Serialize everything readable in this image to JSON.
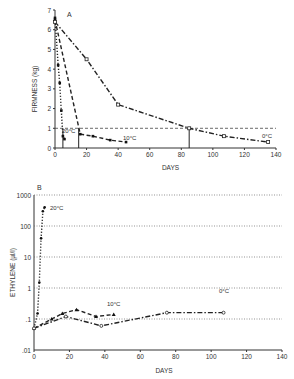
{
  "chart_data": [
    {
      "panel": "A",
      "type": "line",
      "title": "",
      "xlabel": "DAYS",
      "ylabel": "FIRMNESS (kg)",
      "xlim": [
        0,
        140
      ],
      "ylim": [
        0,
        7
      ],
      "xticks": [
        0,
        20,
        40,
        60,
        80,
        100,
        120,
        140
      ],
      "yticks": [
        0,
        1,
        2,
        3,
        4,
        5,
        6,
        7
      ],
      "grid": false,
      "reference_line": {
        "y": 1,
        "style": "dashed"
      },
      "drop_lines_x": [
        5,
        15,
        85
      ],
      "series": [
        {
          "name": "20°C",
          "label": "20°C",
          "style": "dotted",
          "x": [
            0,
            2,
            3,
            4,
            5,
            6
          ],
          "y": [
            6.6,
            4.2,
            3.3,
            1.9,
            0.6,
            0.45
          ]
        },
        {
          "name": "10°C",
          "label": "10°C",
          "style": "dashed",
          "x": [
            0,
            16,
            24,
            35,
            45
          ],
          "y": [
            6.5,
            0.7,
            0.6,
            0.4,
            0.3
          ]
        },
        {
          "name": "0°C",
          "label": "0°C",
          "style": "dash-dot",
          "x": [
            0,
            20,
            40,
            85,
            107,
            135
          ],
          "y": [
            6.4,
            4.5,
            2.2,
            1.0,
            0.6,
            0.3
          ]
        }
      ]
    },
    {
      "panel": "B",
      "type": "line",
      "title": "",
      "xlabel": "DAYS",
      "ylabel": "ETHYLENE (µl/l)",
      "yscale": "log",
      "xlim": [
        0,
        140
      ],
      "ylim": [
        0.01,
        1000
      ],
      "xticks": [
        0,
        20,
        40,
        60,
        80,
        100,
        120,
        140
      ],
      "yticks": [
        0.01,
        0.1,
        1,
        10,
        100,
        1000
      ],
      "ytick_labels": [
        ".01",
        ".1",
        "1",
        "10",
        "100",
        "1000"
      ],
      "grid": "horizontal dotted",
      "series": [
        {
          "name": "20°C",
          "label": "20°C",
          "style": "dotted",
          "x": [
            0,
            2,
            3,
            4,
            5,
            6
          ],
          "y": [
            0.05,
            0.15,
            1.5,
            40,
            300,
            400
          ]
        },
        {
          "name": "10°C",
          "label": "10°C",
          "style": "dashed",
          "x": [
            0,
            10,
            16,
            24,
            35,
            45
          ],
          "y": [
            0.05,
            0.1,
            0.15,
            0.2,
            0.12,
            0.14
          ]
        },
        {
          "name": "0°C",
          "label": "0°C",
          "style": "dash-dot",
          "x": [
            0,
            18,
            38,
            75,
            107
          ],
          "y": [
            0.05,
            0.12,
            0.06,
            0.16,
            0.16
          ]
        }
      ]
    }
  ],
  "panels": {
    "a": {
      "letter": "A",
      "ylabel": "FIRMNESS (kg)",
      "xlabel": "DAYS",
      "labels": {
        "s20": "20°C",
        "s10": "10°C",
        "s0": "0°C"
      }
    },
    "b": {
      "letter": "B",
      "ylabel": "ETHYLENE (µl/l)",
      "xlabel": "DAYS",
      "labels": {
        "s20": "20°C",
        "s10": "10°C",
        "s0": "0°C"
      }
    }
  }
}
